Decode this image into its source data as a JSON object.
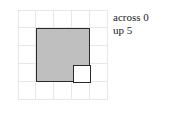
{
  "figure": {
    "name": "grid-with-shaded-square",
    "background_color": "#ffffff"
  },
  "grid": {
    "columns": 5,
    "rows": 5,
    "cell_size_px": 18,
    "line_color": "#e7e7e7"
  },
  "shapes": {
    "outer_square": {
      "label": "shaded-square",
      "fill_color": "#bfbfbf",
      "stroke_color": "#2a2a2a",
      "span_cells": "3x3",
      "origin_cell_col": 1,
      "origin_cell_row": 1
    },
    "inner_square": {
      "label": "inner-white-square",
      "fill_color": "#ffffff",
      "stroke_color": "#2a2a2a",
      "span_cells": "1x1",
      "origin_cell_col": 2,
      "origin_cell_row": 2
    }
  },
  "labels": {
    "across": "across 0",
    "up": "up 5"
  },
  "chart_data": {
    "type": "heatmap",
    "title": "",
    "xlabel": "",
    "ylabel": "",
    "grid": true,
    "legend_position": "right",
    "categories": [
      "0",
      "1",
      "2",
      "3",
      "4"
    ],
    "x": [
      0,
      1,
      2,
      3,
      4
    ],
    "y": [
      0,
      1,
      2,
      3,
      4
    ],
    "values": [
      [
        0,
        0,
        0,
        0,
        0
      ],
      [
        0,
        1,
        1,
        1,
        0
      ],
      [
        0,
        1,
        0,
        1,
        0
      ],
      [
        0,
        1,
        1,
        1,
        0
      ],
      [
        0,
        0,
        0,
        0,
        0
      ]
    ],
    "annotations": [
      "across 0",
      "up 5"
    ]
  }
}
